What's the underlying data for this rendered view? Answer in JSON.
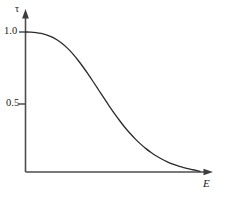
{
  "chart_data": {
    "type": "line",
    "title": "",
    "subtitle": "",
    "xlabel": "E",
    "ylabel": "τ",
    "grid": false,
    "legend": false,
    "legend_position": "none",
    "axis_style": "arrow-headed half-axes",
    "xlim": [
      0,
      1
    ],
    "ylim": [
      0,
      1.12
    ],
    "y_ticks": [
      {
        "value": 1.0,
        "label": "1.0"
      },
      {
        "value": 0.5,
        "label": "0.5"
      }
    ],
    "x_ticks": [],
    "annotations": [],
    "series": [
      {
        "name": "τ(E)",
        "color": "#2b2b2b",
        "x": [
          0.0,
          0.03,
          0.06,
          0.09,
          0.12,
          0.15,
          0.18,
          0.21,
          0.24,
          0.27,
          0.3,
          0.33,
          0.36,
          0.39,
          0.42,
          0.45,
          0.48,
          0.51,
          0.54,
          0.57,
          0.6,
          0.63,
          0.66,
          0.69,
          0.72,
          0.75,
          0.78,
          0.81,
          0.84,
          0.87,
          0.9,
          0.93,
          0.96,
          1.0
        ],
        "y": [
          1.0,
          0.999,
          0.996,
          0.99,
          0.98,
          0.965,
          0.945,
          0.918,
          0.885,
          0.846,
          0.8,
          0.75,
          0.697,
          0.641,
          0.584,
          0.527,
          0.471,
          0.417,
          0.366,
          0.318,
          0.275,
          0.235,
          0.199,
          0.167,
          0.139,
          0.114,
          0.093,
          0.074,
          0.058,
          0.045,
          0.034,
          0.024,
          0.016,
          0.005
        ]
      }
    ]
  },
  "labels": {
    "y_axis": "τ",
    "x_axis": "E",
    "tick_one_zero": "1.0",
    "tick_zero_five": "0.5"
  },
  "colors": {
    "axis": "#4d4d4d",
    "curve": "#2b2b2b",
    "text": "#1a1a1a",
    "background": "#ffffff"
  }
}
